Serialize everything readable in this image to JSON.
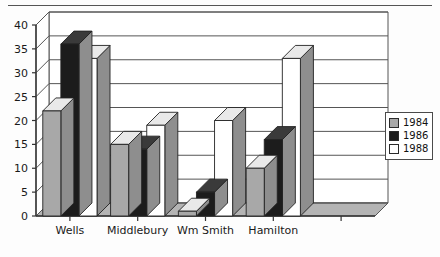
{
  "chart_data": {
    "type": "bar",
    "title": "",
    "subtitle": "",
    "xlabel": "",
    "ylabel": "",
    "ylim": [
      0,
      40
    ],
    "yticks": [
      0,
      5,
      10,
      15,
      20,
      25,
      30,
      35,
      40
    ],
    "ytick_labels": [
      "0",
      "5",
      "10",
      "15",
      "20",
      "25",
      "30",
      "35",
      "40"
    ],
    "grid": true,
    "grid_axis": "y",
    "three_d": true,
    "legend_position": "right",
    "categories": [
      "Wells",
      "Middlebury",
      "Wm Smith",
      "Hamilton",
      ""
    ],
    "series": [
      {
        "name": "1984",
        "color": "#a8a8a8",
        "values": [
          22,
          15,
          1,
          10,
          0
        ]
      },
      {
        "name": "1986",
        "color": "#1c1c1c",
        "values": [
          36,
          14,
          5,
          16,
          0
        ]
      },
      {
        "name": "1988",
        "color": "#ffffff",
        "values": [
          33,
          19,
          20,
          33,
          0
        ]
      }
    ]
  },
  "legend": {
    "entries": [
      {
        "label": "1984",
        "swatch": "gray"
      },
      {
        "label": "1986",
        "swatch": "black"
      },
      {
        "label": "1988",
        "swatch": "white"
      }
    ]
  },
  "colors": {
    "series_1984": "#a8a8a8",
    "series_1986": "#1c1c1c",
    "series_1988": "#ffffff",
    "axis": "#333333",
    "grid": "#555555",
    "floor": "#b4b4b4",
    "text": "#1a1a1a"
  }
}
